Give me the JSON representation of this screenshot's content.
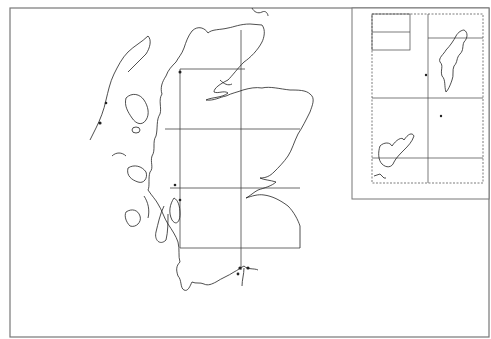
{
  "map": {
    "title": "",
    "region": "Scotland",
    "inset_region": "Orkney and Shetland",
    "colors": {
      "background": "#ffffff",
      "line": "#333333",
      "frame": "#777777"
    },
    "frame": {
      "x": 10,
      "y": 8,
      "width": 479,
      "height": 329
    },
    "inset_frame": {
      "x": 352,
      "y": 8,
      "width": 137,
      "height": 191
    },
    "main_grid": {
      "vertical": [
        {
          "x": 180,
          "y1": 69,
          "y2": 248
        },
        {
          "x": 241,
          "y1": 8,
          "y2": 270
        }
      ],
      "horizontal": [
        {
          "y": 69,
          "x1": 180,
          "x2": 245
        },
        {
          "y": 129,
          "x1": 165,
          "x2": 300
        },
        {
          "y": 188,
          "x1": 170,
          "x2": 300
        },
        {
          "y": 248,
          "x1": 180,
          "x2": 300
        }
      ]
    },
    "inset_grid": {
      "vertical": [
        {
          "x": 428,
          "y1": 14,
          "y2": 183
        }
      ],
      "horizontal": [
        {
          "y": 38,
          "x1": 428,
          "x2": 483
        },
        {
          "y": 98,
          "x1": 372,
          "x2": 483
        },
        {
          "y": 158,
          "x1": 372,
          "x2": 483
        }
      ],
      "box": {
        "x": 372,
        "y": 14,
        "width": 38,
        "height": 36,
        "divider_y": 32
      }
    }
  }
}
